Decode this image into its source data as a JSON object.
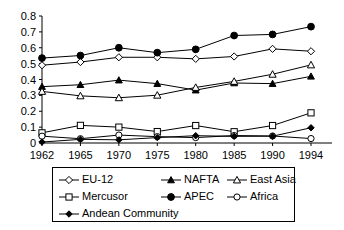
{
  "chart_data": {
    "type": "line",
    "title": "",
    "subtitle": "",
    "xlabel": "",
    "ylabel": "",
    "x": [
      1962,
      1965,
      1970,
      1975,
      1980,
      1985,
      1990,
      1994
    ],
    "categories": [
      "1962",
      "1965",
      "1970",
      "1975",
      "1980",
      "1985",
      "1990",
      "1994"
    ],
    "xtick_labels": [
      "1962",
      "1965",
      "1970",
      "1975",
      "1980",
      "1985",
      "1990",
      "1994"
    ],
    "ytick_labels": [
      "0",
      "0.1",
      "0.2",
      "0.3",
      "0.4",
      "0.5",
      "0.6",
      "0.7",
      "0.8"
    ],
    "ytick_values": [
      0,
      0.1,
      0.2,
      0.3,
      0.4,
      0.5,
      0.6,
      0.7,
      0.8
    ],
    "ylim": [
      0,
      0.8
    ],
    "xlim": [
      1962,
      1994
    ],
    "grid": false,
    "legend_position": "bottom",
    "series": [
      {
        "name": "EU-12",
        "marker": "open-diamond",
        "values": [
          0.49,
          0.51,
          0.54,
          0.54,
          0.53,
          0.545,
          0.593,
          0.578
        ]
      },
      {
        "name": "NAFTA",
        "marker": "filled-triangle",
        "values": [
          0.355,
          0.367,
          0.396,
          0.374,
          0.333,
          0.378,
          0.374,
          0.42
        ]
      },
      {
        "name": "East Asia",
        "marker": "open-triangle",
        "values": [
          0.325,
          0.297,
          0.285,
          0.301,
          0.35,
          0.388,
          0.433,
          0.492
        ]
      },
      {
        "name": "Mercusor",
        "marker": "open-square",
        "values": [
          0.064,
          0.111,
          0.1,
          0.072,
          0.11,
          0.071,
          0.11,
          0.19
        ]
      },
      {
        "name": "APEC",
        "marker": "filled-circle",
        "values": [
          0.535,
          0.551,
          0.6,
          0.569,
          0.59,
          0.677,
          0.684,
          0.733
        ]
      },
      {
        "name": "Africa",
        "marker": "open-circle",
        "values": [
          0.043,
          0.027,
          0.05,
          0.04,
          0.034,
          0.047,
          0.044,
          0.028
        ]
      },
      {
        "name": "Andean Community",
        "marker": "small-filled-diamond",
        "values": [
          0.006,
          0.023,
          0.02,
          0.034,
          0.046,
          0.042,
          0.043,
          0.096
        ]
      }
    ]
  },
  "legend": {
    "rows": [
      [
        {
          "label": "EU-12",
          "marker": "open-diamond"
        },
        {
          "label": "NAFTA",
          "marker": "filled-triangle"
        },
        {
          "label": "East Asia",
          "marker": "open-triangle"
        }
      ],
      [
        {
          "label": "Mercusor",
          "marker": "open-square"
        },
        {
          "label": "APEC",
          "marker": "filled-circle"
        },
        {
          "label": "Africa",
          "marker": "open-circle"
        }
      ],
      [
        {
          "label": "Andean Community",
          "marker": "small-filled-diamond"
        }
      ]
    ]
  },
  "colors": {
    "line": "#000000",
    "marker_fill_open": "#ffffff",
    "marker_fill_closed": "#000000",
    "axis": "#000000",
    "background": "#ffffff"
  }
}
